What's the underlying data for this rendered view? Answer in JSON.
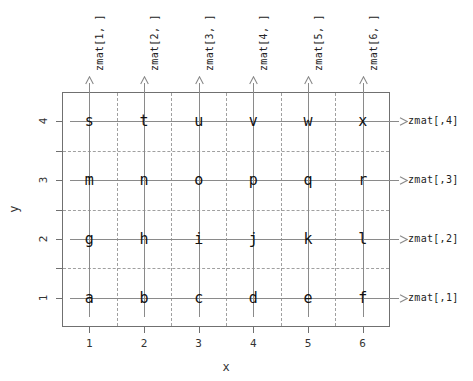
{
  "figure": {
    "type": "matrix-index-diagram",
    "background": "#ffffff"
  },
  "axes": {
    "x_title": "x",
    "y_title": "y",
    "x_ticks": [
      "1",
      "2",
      "3",
      "4",
      "5",
      "6"
    ],
    "y_ticks": [
      "1",
      "2",
      "3",
      "4"
    ],
    "x_tick_values": [
      1,
      2,
      3,
      4,
      5,
      6
    ],
    "y_tick_values": [
      1,
      2,
      3,
      4
    ],
    "xlim": [
      0.5,
      6.5
    ],
    "ylim": [
      0.5,
      4.5
    ]
  },
  "column_labels": [
    "zmat[1, ]",
    "zmat[2, ]",
    "zmat[3, ]",
    "zmat[4, ]",
    "zmat[5, ]",
    "zmat[6, ]"
  ],
  "row_labels": [
    "zmat[,1]",
    "zmat[,2]",
    "zmat[,3]",
    "zmat[,4]"
  ],
  "chart_data": {
    "type": "heatmap",
    "title": "",
    "xlabel": "x",
    "ylabel": "y",
    "x": [
      1,
      2,
      3,
      4,
      5,
      6
    ],
    "y": [
      1,
      2,
      3,
      4
    ],
    "xlim": [
      0.5,
      6.5
    ],
    "ylim": [
      0.5,
      4.5
    ],
    "grid": "dashed cell boundaries at half-integer positions",
    "legend": "none",
    "cell_text_rows": [
      {
        "y": 4,
        "row_label": "zmat[,4]",
        "values": [
          "s",
          "t",
          "u",
          "v",
          "w",
          "x"
        ]
      },
      {
        "y": 3,
        "row_label": "zmat[,3]",
        "values": [
          "m",
          "n",
          "o",
          "p",
          "q",
          "r"
        ]
      },
      {
        "y": 2,
        "row_label": "zmat[,2]",
        "values": [
          "g",
          "h",
          "i",
          "j",
          "k",
          "l"
        ]
      },
      {
        "y": 1,
        "row_label": "zmat[,1]",
        "values": [
          "a",
          "b",
          "c",
          "d",
          "e",
          "f"
        ]
      }
    ],
    "column_labels": [
      "zmat[1, ]",
      "zmat[2, ]",
      "zmat[3, ]",
      "zmat[4, ]",
      "zmat[5, ]",
      "zmat[6, ]"
    ],
    "annotations": [
      "vertical arrows point up from each column, labelled zmat[i, ]",
      "horizontal arrows point right from each row, labelled zmat[,j]"
    ]
  },
  "colors": {
    "box_border": "#707070",
    "solid_guide": "#8a8a8a",
    "dashed_grid": "#a0a0a0",
    "text": "#222222"
  }
}
